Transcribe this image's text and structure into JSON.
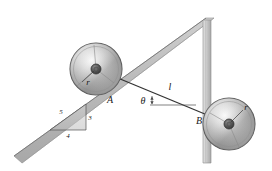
{
  "figure": {
    "background_color": "#ffffff",
    "width": 272,
    "height": 171
  },
  "labels": {
    "point_a": "A",
    "point_b": "B",
    "radius_top": "r",
    "radius_bottom": "r",
    "cable_length": "l",
    "angle": "θ",
    "slope_hyp": "5",
    "slope_rise": "3",
    "slope_run": "4"
  },
  "colors": {
    "incline_fill": "#b5b5b5",
    "incline_top_edge": "#8f8f8f",
    "post_fill": "#c9c9c9",
    "post_edge": "#8a8a8a",
    "disc_rim": "#5a5a5a",
    "disc_light": "#f2f2f2",
    "disc_mid": "#b0b0b0",
    "disc_dark": "#7c7c7c",
    "hub": "#4a4a4a",
    "cable": "#3a3a3a",
    "label_text": "#1a1a1a"
  },
  "geometry": {
    "incline_slope_ratio": "3:4",
    "pulley_top_center": [
      96,
      69
    ],
    "pulley_top_radius": 26,
    "pulley_bottom_center": [
      229,
      124
    ],
    "pulley_bottom_radius": 26,
    "point_a": [
      110,
      95
    ],
    "point_b": [
      203,
      121
    ],
    "post_top": [
      208,
      18
    ],
    "post_bottom": [
      208,
      163
    ]
  },
  "icons": {
    "pulley_top": "pulley-disc-icon",
    "pulley_bottom": "pulley-disc-icon",
    "incline": "inclined-plane-icon",
    "post": "vertical-post-icon",
    "cable": "cable-line-icon",
    "angle_marker": "angle-marker-icon",
    "slope_triangle": "slope-triangle-icon"
  }
}
